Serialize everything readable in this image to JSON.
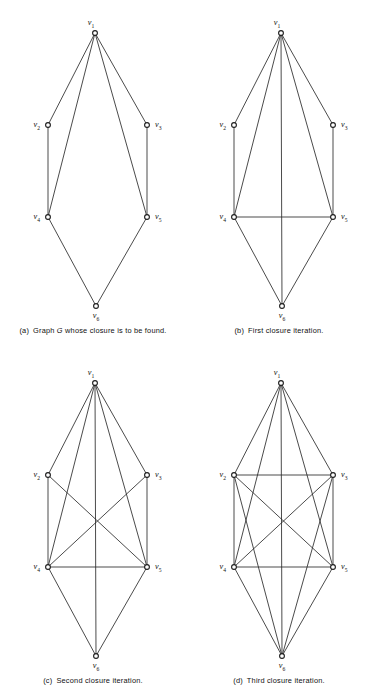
{
  "figure": {
    "width": 372,
    "height": 693,
    "background_color": "#ffffff",
    "line_color": "#2b2b2b",
    "vertex_fill_color": "#ffffff",
    "vertex_stroke_color": "#1c1c1c",
    "label_color": "#111111"
  },
  "vertices": [
    {
      "id": "v1",
      "label": "v",
      "sub": "1",
      "x": 95,
      "y": 33,
      "label_dx": -4,
      "label_dy": -8,
      "anchor": "middle"
    },
    {
      "id": "v2",
      "label": "v",
      "sub": "2",
      "x": 48,
      "y": 125,
      "label_dx": -8,
      "label_dy": 2,
      "anchor": "end"
    },
    {
      "id": "v3",
      "label": "v",
      "sub": "3",
      "x": 147,
      "y": 125,
      "label_dx": 8,
      "label_dy": 2,
      "anchor": "start"
    },
    {
      "id": "v4",
      "label": "v",
      "sub": "4",
      "x": 48,
      "y": 217,
      "label_dx": -8,
      "label_dy": 2,
      "anchor": "end"
    },
    {
      "id": "v5",
      "label": "v",
      "sub": "5",
      "x": 147,
      "y": 217,
      "label_dx": 8,
      "label_dy": 2,
      "anchor": "start"
    },
    {
      "id": "v6",
      "label": "v",
      "sub": "6",
      "x": 96,
      "y": 306,
      "label_dx": 0,
      "label_dy": 12,
      "anchor": "middle"
    }
  ],
  "panels": [
    {
      "key": "a",
      "tag": "(a)",
      "caption_before": "Graph ",
      "caption_italic": "G",
      "caption_after": " whose closure is to be found.",
      "caption_plain": "(a)  Graph G whose closure is to be found.",
      "edges": [
        [
          "v1",
          "v2"
        ],
        [
          "v1",
          "v3"
        ],
        [
          "v1",
          "v4"
        ],
        [
          "v1",
          "v5"
        ],
        [
          "v2",
          "v4"
        ],
        [
          "v3",
          "v5"
        ],
        [
          "v4",
          "v6"
        ],
        [
          "v5",
          "v6"
        ]
      ],
      "edge_count": 8
    },
    {
      "key": "b",
      "tag": "(b)",
      "caption_before": "First closure iteration.",
      "caption_italic": "",
      "caption_after": "",
      "caption_plain": "(b)  First closure iteration.",
      "edges": [
        [
          "v1",
          "v2"
        ],
        [
          "v1",
          "v3"
        ],
        [
          "v1",
          "v4"
        ],
        [
          "v1",
          "v5"
        ],
        [
          "v1",
          "v6"
        ],
        [
          "v2",
          "v4"
        ],
        [
          "v3",
          "v5"
        ],
        [
          "v4",
          "v5"
        ],
        [
          "v4",
          "v6"
        ],
        [
          "v5",
          "v6"
        ]
      ],
      "edge_count": 10
    },
    {
      "key": "c",
      "tag": "(c)",
      "caption_before": "Second closure iteration.",
      "caption_italic": "",
      "caption_after": "",
      "caption_plain": "(c)  Second closure iteration.",
      "edges": [
        [
          "v1",
          "v2"
        ],
        [
          "v1",
          "v3"
        ],
        [
          "v1",
          "v4"
        ],
        [
          "v1",
          "v5"
        ],
        [
          "v1",
          "v6"
        ],
        [
          "v2",
          "v4"
        ],
        [
          "v2",
          "v5"
        ],
        [
          "v3",
          "v4"
        ],
        [
          "v3",
          "v5"
        ],
        [
          "v4",
          "v5"
        ],
        [
          "v4",
          "v6"
        ],
        [
          "v5",
          "v6"
        ]
      ],
      "edge_count": 12
    },
    {
      "key": "d",
      "tag": "(d)",
      "caption_before": "Third closure iteration.",
      "caption_italic": "",
      "caption_after": "",
      "caption_plain": "(d)  Third closure iteration.",
      "edges": [
        [
          "v1",
          "v2"
        ],
        [
          "v1",
          "v3"
        ],
        [
          "v1",
          "v4"
        ],
        [
          "v1",
          "v5"
        ],
        [
          "v1",
          "v6"
        ],
        [
          "v2",
          "v3"
        ],
        [
          "v2",
          "v4"
        ],
        [
          "v2",
          "v5"
        ],
        [
          "v2",
          "v6"
        ],
        [
          "v3",
          "v4"
        ],
        [
          "v3",
          "v5"
        ],
        [
          "v3",
          "v6"
        ],
        [
          "v4",
          "v5"
        ],
        [
          "v4",
          "v6"
        ],
        [
          "v5",
          "v6"
        ]
      ],
      "edge_count": 15
    }
  ]
}
